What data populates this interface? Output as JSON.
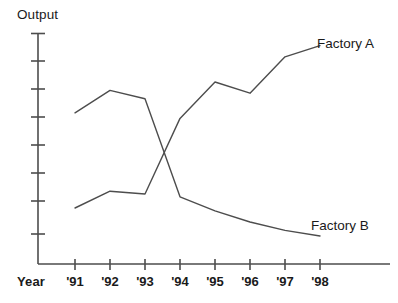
{
  "chart_data": {
    "type": "line",
    "title": "",
    "xlabel": "Year",
    "ylabel": "Output",
    "grid": false,
    "legend_position": "inline-right-of-line-ends",
    "x": [
      "'91",
      "'92",
      "'93",
      "'94",
      "'95",
      "'96",
      "'97",
      "'98"
    ],
    "categories": [
      "'91",
      "'92",
      "'93",
      "'94",
      "'95",
      "'96",
      "'97",
      "'98"
    ],
    "xlim": [
      0,
      9
    ],
    "ylim": [
      0,
      9
    ],
    "y_tick_count": 8,
    "series": [
      {
        "name": "Factory A",
        "values": [
          2.0,
          2.6,
          2.5,
          5.2,
          6.5,
          6.1,
          7.4,
          7.8
        ]
      },
      {
        "name": "Factory B",
        "values": [
          5.4,
          6.2,
          5.9,
          2.4,
          1.9,
          1.5,
          1.2,
          1.0
        ]
      }
    ],
    "annotations": [
      {
        "text": "Factory A",
        "series": "Factory A",
        "at": "'98"
      },
      {
        "text": "Factory B",
        "series": "Factory B",
        "at": "'98"
      }
    ]
  },
  "axes": {
    "y_axis_title": "Output",
    "x_axis_title": "Year",
    "x_tick_labels": [
      "'91",
      "'92",
      "'93",
      "'94",
      "'95",
      "'96",
      "'97",
      "'98"
    ]
  },
  "labels": {
    "factory_a": "Factory A",
    "factory_b": "Factory B"
  },
  "colors": {
    "line": "#4d4d4d",
    "axis": "#4d4d4d",
    "text": "#1a1a1a",
    "background": "#ffffff"
  }
}
